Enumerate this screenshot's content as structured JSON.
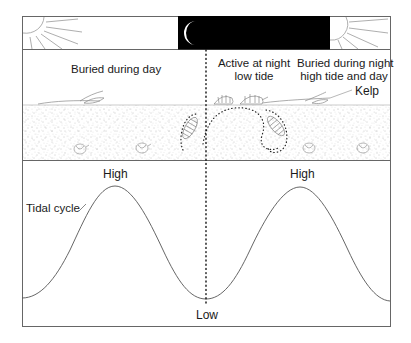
{
  "diagram": {
    "top_band": {
      "day_left": "sun-icon",
      "night": "crescent-moon-icon",
      "day_right": "sun-icon",
      "night_color": "#000000"
    },
    "labels": {
      "buried_day": "Buried during day",
      "active_night_line1": "Active at night",
      "active_night_line2": "low tide",
      "buried_night_line1": "Buried during night",
      "buried_night_line2": "high tide and day",
      "kelp": "Kelp"
    },
    "tidal_panel": {
      "title": "Tidal cycle",
      "high_left": "High",
      "high_right": "High",
      "low": "Low"
    },
    "colors": {
      "line": "#555555",
      "sand_dot": "#8a8a8a",
      "frame": "#666666"
    }
  }
}
